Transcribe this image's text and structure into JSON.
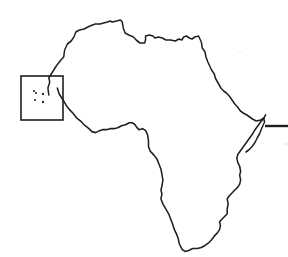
{
  "map": {
    "subject": "Africa continent outline",
    "style": "black line art on white",
    "colors": {
      "outline": "#1e1e1e",
      "background": "#ffffff"
    },
    "inset": {
      "description": "small island group shown in box to the west",
      "island_count": 5
    },
    "pointer": {
      "description": "horizontal line extending east from the Horn of Africa coast"
    }
  }
}
